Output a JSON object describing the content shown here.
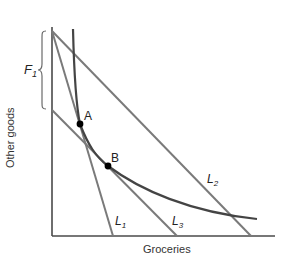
{
  "diagram": {
    "type": "indifference-curve-budget-lines",
    "axes": {
      "x_label": "Groceries",
      "y_label": "Other goods"
    },
    "budget_lines": [
      {
        "id": "L1",
        "label_main": "L",
        "label_sub": "1"
      },
      {
        "id": "L2",
        "label_main": "L",
        "label_sub": "2"
      },
      {
        "id": "L3",
        "label_main": "L",
        "label_sub": "3"
      }
    ],
    "points": [
      {
        "id": "A",
        "label": "A",
        "on": [
          "L1",
          "indifference-curve"
        ]
      },
      {
        "id": "B",
        "label": "B",
        "on": [
          "L3",
          "indifference-curve"
        ]
      }
    ],
    "bracket": {
      "label_main": "F",
      "label_sub": "1",
      "description": "vertical distance between L1/L2 intercept and L3 intercept on Other goods axis"
    },
    "colors": {
      "axis": "#4a4a4a",
      "budget_line": "#7a7a7a",
      "curve": "#444444",
      "point": "#000000"
    }
  }
}
